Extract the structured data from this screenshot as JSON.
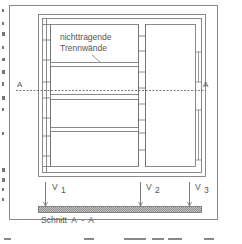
{
  "figure": {
    "type": "floor-plan-with-section",
    "frame_color": "#8a8a8a",
    "line_color": "#6e6e6e",
    "text_color": "#555555",
    "hatch_color": "#9a9a9a"
  },
  "plan": {
    "annotation_line1": "nichttragende",
    "annotation_line2": "Trennwände",
    "section_marker_left": "A",
    "section_marker_right": "A"
  },
  "section": {
    "title": "Schnitt  A  -  A",
    "loads": [
      {
        "symbol": "V",
        "index": "1"
      },
      {
        "symbol": "V",
        "index": "2"
      },
      {
        "symbol": "V",
        "index": "3"
      }
    ]
  }
}
